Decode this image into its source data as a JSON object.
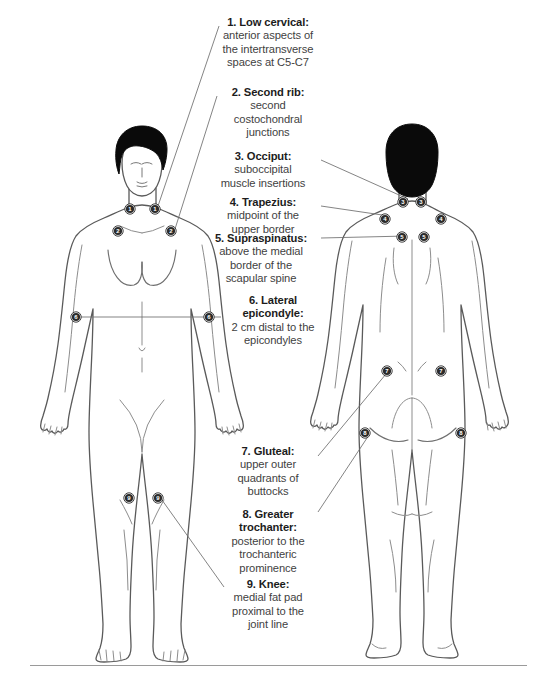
{
  "diagram": {
    "figures": [
      {
        "name": "anterior-body-figure",
        "view": "front"
      },
      {
        "name": "posterior-body-figure",
        "view": "back"
      }
    ],
    "colors": {
      "outline": "#5a5a5a",
      "hair": "#0a0a0a",
      "marker_fill": "#2b2b2b",
      "marker_ring": "#ffffff",
      "leader_line": "#6e6e6e",
      "title_text": "#1c1c1c",
      "body_text": "#3f3f3f",
      "rule": "#9a9a9a"
    }
  },
  "tender_points": [
    {
      "number": "1",
      "title": "1. Low cervical:",
      "description": "anterior aspects of the intertransverse spaces at C5-C7",
      "lines": [
        "anterior aspects of",
        "the intertransverse",
        "spaces at C5-C7"
      ],
      "view": "front",
      "markers": [
        [
          130,
          209
        ],
        [
          155,
          209
        ]
      ]
    },
    {
      "number": "2",
      "title": "2. Second rib:",
      "description": "second costochondral junctions",
      "lines": [
        "second",
        "costochondral",
        "junctions"
      ],
      "view": "front",
      "markers": [
        [
          118,
          231
        ],
        [
          171,
          231
        ]
      ]
    },
    {
      "number": "3",
      "title": "3. Occiput:",
      "description": "suboccipital muscle insertions",
      "lines": [
        "suboccipital",
        "muscle insertions"
      ],
      "view": "back",
      "markers": [
        [
          403,
          202
        ],
        [
          421,
          202
        ]
      ]
    },
    {
      "number": "4",
      "title": "4. Trapezius:",
      "description": "midpoint of the upper border",
      "lines": [
        "midpoint of the",
        "upper border"
      ],
      "view": "back",
      "markers": [
        [
          385,
          219
        ],
        [
          441,
          219
        ]
      ]
    },
    {
      "number": "5",
      "title": "5. Supraspinatus:",
      "description": "above the medial border of the scapular spine",
      "lines": [
        "above the medial",
        "border of the",
        "scapular spine"
      ],
      "view": "back",
      "markers": [
        [
          402,
          237
        ],
        [
          424,
          237
        ]
      ]
    },
    {
      "number": "6",
      "title": "6. Lateral epicondyle:",
      "title_lines": [
        "6. Lateral",
        "epicondyle:"
      ],
      "description": "2 cm distal to the epicondyles",
      "lines": [
        "2 cm distal to the",
        "epicondyles"
      ],
      "view": "front",
      "markers": [
        [
          76,
          317
        ],
        [
          209,
          317
        ]
      ]
    },
    {
      "number": "7",
      "title": "7. Gluteal:",
      "description": "upper outer quadrants of buttocks",
      "lines": [
        "upper outer",
        "quadrants of",
        "buttocks"
      ],
      "view": "back",
      "markers": [
        [
          387,
          371
        ],
        [
          441,
          371
        ]
      ]
    },
    {
      "number": "8",
      "title": "8. Greater trochanter:",
      "title_lines": [
        "8. Greater",
        "trochanter:"
      ],
      "description": "posterior to the trochanteric prominence",
      "lines": [
        "posterior to the",
        "trochanteric",
        "prominence"
      ],
      "view": "back",
      "markers": [
        [
          365,
          433
        ],
        [
          461,
          433
        ]
      ]
    },
    {
      "number": "9",
      "title": "9. Knee:",
      "description": "medial fat pad proximal to the joint line",
      "lines": [
        "medial fat pad",
        "proximal to the",
        "joint line"
      ],
      "view": "front",
      "markers": [
        [
          129,
          498
        ],
        [
          158,
          498
        ]
      ]
    }
  ]
}
